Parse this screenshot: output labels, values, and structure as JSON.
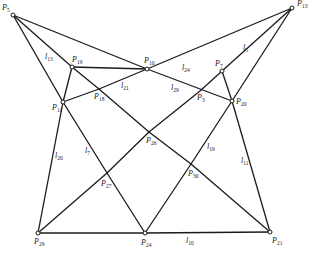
{
  "figure": {
    "stroke_color": "#1a1a1a",
    "background": "#ffffff",
    "points": [
      {
        "id": "P5",
        "name": "P",
        "sub": "5",
        "x": 13,
        "y": 15,
        "lx": 2,
        "ly": 4
      },
      {
        "id": "P13",
        "name": "P",
        "sub": "13",
        "x": 292,
        "y": 8,
        "lx": 297,
        "ly": 0
      },
      {
        "id": "P19",
        "name": "P",
        "sub": "19",
        "x": 72,
        "y": 67,
        "lx": 72,
        "ly": 56
      },
      {
        "id": "P10",
        "name": "P",
        "sub": "10",
        "x": 147,
        "y": 69,
        "lx": 144,
        "ly": 57
      },
      {
        "id": "P11",
        "name": "P",
        "sub": "11",
        "x": 63,
        "y": 102,
        "lx": 52,
        "ly": 104
      },
      {
        "id": "P18",
        "name": "P",
        "sub": "18",
        "x": 99,
        "y": 89,
        "lx": 94,
        "ly": 93
      },
      {
        "id": "P7",
        "name": "P",
        "sub": "7",
        "x": 222,
        "y": 71,
        "lx": 215,
        "ly": 60
      },
      {
        "id": "P3",
        "name": "P",
        "sub": "3",
        "x": 200,
        "y": 91,
        "lx": 197,
        "ly": 94
      },
      {
        "id": "P20",
        "name": "P",
        "sub": "20",
        "x": 232,
        "y": 101,
        "lx": 236,
        "ly": 98
      },
      {
        "id": "P26",
        "name": "P",
        "sub": "26",
        "x": 149,
        "y": 132,
        "lx": 146,
        "ly": 137
      },
      {
        "id": "P30",
        "name": "P",
        "sub": "30",
        "x": 191,
        "y": 164,
        "lx": 188,
        "ly": 170
      },
      {
        "id": "P27",
        "name": "P",
        "sub": "27",
        "x": 107,
        "y": 173,
        "lx": 101,
        "ly": 180
      },
      {
        "id": "P29",
        "name": "P",
        "sub": "29",
        "x": 38,
        "y": 233,
        "lx": 34,
        "ly": 238
      },
      {
        "id": "P24",
        "name": "P",
        "sub": "24",
        "x": 145,
        "y": 233,
        "lx": 141,
        "ly": 239
      },
      {
        "id": "P21",
        "name": "P",
        "sub": "21",
        "x": 270,
        "y": 232,
        "lx": 272,
        "ly": 237
      }
    ],
    "marked_points": [
      "P5",
      "P13",
      "P19",
      "P10",
      "P11",
      "P7",
      "P20",
      "P29",
      "P24",
      "P21"
    ],
    "segments": [
      [
        "P5",
        "P10"
      ],
      [
        "P10",
        "P20"
      ],
      [
        "P5",
        "P11"
      ],
      [
        "P11",
        "P27"
      ],
      [
        "P27",
        "P24"
      ],
      [
        "P5",
        "P19"
      ],
      [
        "P13",
        "P10"
      ],
      [
        "P13",
        "P7"
      ],
      [
        "P7",
        "P3"
      ],
      [
        "P3",
        "P26"
      ],
      [
        "P26",
        "P27"
      ],
      [
        "P27",
        "P29"
      ],
      [
        "P13",
        "P20"
      ],
      [
        "P20",
        "P30"
      ],
      [
        "P30",
        "P24"
      ],
      [
        "P19",
        "P10"
      ],
      [
        "P11",
        "P18"
      ],
      [
        "P18",
        "P10"
      ],
      [
        "P19",
        "P11"
      ],
      [
        "P19",
        "P18"
      ],
      [
        "P18",
        "P26"
      ],
      [
        "P26",
        "P30"
      ],
      [
        "P30",
        "P21"
      ],
      [
        "P7",
        "P20"
      ],
      [
        "P20",
        "P21"
      ],
      [
        "P29",
        "P11"
      ],
      [
        "P29",
        "P24"
      ],
      [
        "P24",
        "P21"
      ]
    ],
    "line_labels": [
      {
        "name": "l",
        "sub": "13",
        "x": 45,
        "y": 53
      },
      {
        "name": "l",
        "sub": "21",
        "x": 121,
        "y": 82
      },
      {
        "name": "l",
        "sub": "24",
        "x": 182,
        "y": 64
      },
      {
        "name": "l",
        "sub": "29",
        "x": 171,
        "y": 84
      },
      {
        "name": "l",
        "sub": "5",
        "x": 243,
        "y": 44
      },
      {
        "name": "l",
        "sub": "20",
        "x": 55,
        "y": 152
      },
      {
        "name": "l",
        "sub": "7",
        "x": 85,
        "y": 147
      },
      {
        "name": "l",
        "sub": "19",
        "x": 207,
        "y": 143
      },
      {
        "name": "l",
        "sub": "11",
        "x": 241,
        "y": 157
      },
      {
        "name": "l",
        "sub": "10",
        "x": 186,
        "y": 237
      }
    ]
  }
}
